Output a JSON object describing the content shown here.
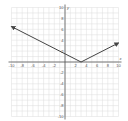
{
  "chart_data": {
    "type": "line",
    "title": "",
    "xlabel": "x",
    "ylabel": "y",
    "xlim": [
      -10,
      10
    ],
    "ylim": [
      -10,
      10
    ],
    "grid": true,
    "x_ticks": [
      -10,
      -8,
      -6,
      -4,
      -2,
      2,
      4,
      6,
      8,
      10
    ],
    "y_ticks": [
      10,
      8,
      6,
      4,
      2,
      -2,
      -4,
      -6,
      -8,
      -10
    ],
    "series": [
      {
        "name": "y = 0.5|x - 3|",
        "points": [
          [
            -10,
            6.5
          ],
          [
            0,
            1.5
          ],
          [
            3,
            0
          ],
          [
            10,
            3.5
          ]
        ],
        "arrows": "both-ends",
        "color": "#444444"
      }
    ],
    "vertex": [
      3,
      0
    ]
  },
  "axis": {
    "x_label": "x",
    "y_label": "y"
  }
}
